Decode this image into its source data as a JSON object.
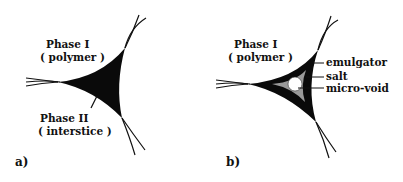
{
  "panel_a": {
    "label": "a)",
    "phase1_title": "Phase I",
    "phase1_sub": "( polymer )",
    "phase2_title": "Phase II",
    "phase2_sub": "( interstice )"
  },
  "panel_b": {
    "label": "b)",
    "phase1_title": "Phase I",
    "phase1_sub": "( polymer )",
    "callouts": [
      "emulgator",
      "salt",
      "micro-void"
    ]
  },
  "colors": {
    "fill_dark": "#0a0a0a",
    "salt_gray": "#9a9a9a",
    "void": "#ffffff"
  }
}
